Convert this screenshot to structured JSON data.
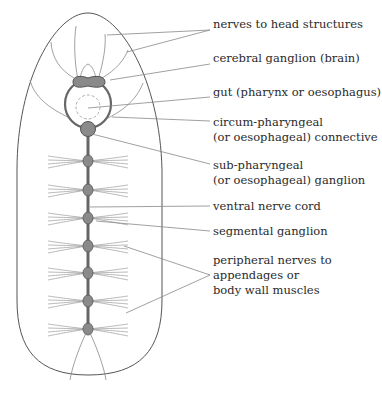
{
  "diagram": {
    "labels": [
      {
        "id": "nerves-head",
        "lines": [
          "nerves to head structures"
        ],
        "x": 213,
        "y": 17
      },
      {
        "id": "cerebral-ganglion",
        "lines": [
          "cerebral ganglion (brain)"
        ],
        "x": 213,
        "y": 51
      },
      {
        "id": "gut",
        "lines": [
          "gut (pharynx or oesophagus)"
        ],
        "x": 213,
        "y": 85
      },
      {
        "id": "circum-pharyngeal",
        "lines": [
          "circum-pharyngeal",
          "(or oesophageal) connective"
        ],
        "x": 213,
        "y": 115
      },
      {
        "id": "sub-pharyngeal",
        "lines": [
          "sub-pharyngeal",
          "(or oesophageal) ganglion"
        ],
        "x": 213,
        "y": 158
      },
      {
        "id": "ventral-cord",
        "lines": [
          "ventral nerve cord"
        ],
        "x": 213,
        "y": 199
      },
      {
        "id": "segmental-ganglion",
        "lines": [
          "segmental ganglion"
        ],
        "x": 213,
        "y": 224
      },
      {
        "id": "peripheral-nerves",
        "lines": [
          "peripheral nerves to",
          "appendages or",
          "body wall muscles"
        ],
        "x": 213,
        "y": 253
      }
    ],
    "ganglia_y": [
      161,
      190,
      218,
      246,
      273,
      301,
      329
    ],
    "colors": {
      "outline": "#555555",
      "ganglion": "#8a8a8a",
      "nerve": "#888888",
      "text": "#2a2a2a"
    }
  }
}
